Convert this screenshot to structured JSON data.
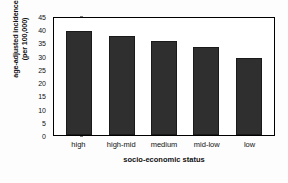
{
  "chart_data": {
    "type": "bar",
    "title": "",
    "categories": [
      "high",
      "high-mid",
      "medium",
      "mid-low",
      "low"
    ],
    "values": [
      39.5,
      37.3,
      35.5,
      33.3,
      29.0
    ],
    "xlabel": "socio-economic status",
    "ylabel_line1": "age-adjusted incidence",
    "ylabel_line2": "(per 100,000)",
    "ylim": [
      0,
      45
    ],
    "yticks": [
      0,
      5,
      10,
      15,
      20,
      25,
      30,
      35,
      40,
      45
    ],
    "ytick_labels": [
      "0",
      "5",
      "10",
      "15",
      "20",
      "25",
      "30",
      "35",
      "40",
      "45"
    ],
    "grid": false,
    "legend": null,
    "bar_color": "#2f2f2f",
    "axis_color": "#000000",
    "background": "#ffffff"
  }
}
